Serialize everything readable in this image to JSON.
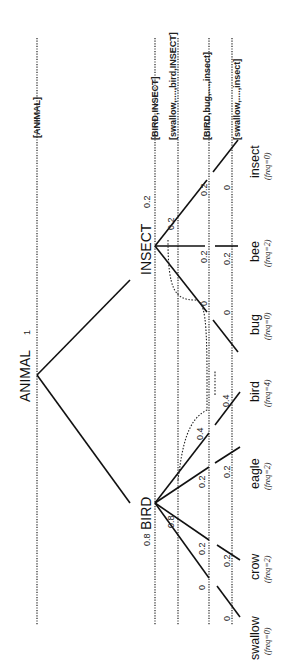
{
  "diagram": {
    "root": {
      "label": "ANIMAL",
      "prob": "1"
    },
    "categories": [
      {
        "label": "BIRD",
        "prob": "0.8"
      },
      {
        "label": "INSECT",
        "prob": "0.2"
      }
    ],
    "leaves": [
      {
        "label": "swallow",
        "freq": "(freq=0)",
        "parent": "BIRD"
      },
      {
        "label": "crow",
        "freq": "(freq=2)",
        "parent": "BIRD"
      },
      {
        "label": "eagle",
        "freq": "(freq=2)",
        "parent": "BIRD"
      },
      {
        "label": "bird",
        "freq": "(freq=4)",
        "parent": "BIRD"
      },
      {
        "label": "bug",
        "freq": "(freq=0)",
        "parent": "INSECT"
      },
      {
        "label": "bee",
        "freq": "(freq=2)",
        "parent": "INSECT"
      },
      {
        "label": "insect",
        "freq": "(freq=0)",
        "parent": "INSECT"
      }
    ],
    "levels": [
      {
        "label": "[ANIMAL]"
      },
      {
        "label": "[BIRD,INSECT]"
      },
      {
        "label": "[swallow,....,bird,INSECT]"
      },
      {
        "label": "[BIRD,bug,....,insect]"
      },
      {
        "label": "[swallow,....,insect]"
      }
    ],
    "values": {
      "level2_bird": "0.8",
      "level2_insect": "0.2",
      "level3_swallow": "0",
      "level3_crow": "0.2",
      "level3_eagle": "0.2",
      "level3_bird": "0.4",
      "level3_bug": "0",
      "level3_bee": "0.2",
      "level3_insect": "0.2",
      "level4_swallow": "0",
      "level4_crow": "0.2",
      "level4_eagle": "0.2",
      "level4_bird": "0.4",
      "level4_bug": "0",
      "level4_bee": "0.2",
      "level4_insect": "0"
    }
  }
}
